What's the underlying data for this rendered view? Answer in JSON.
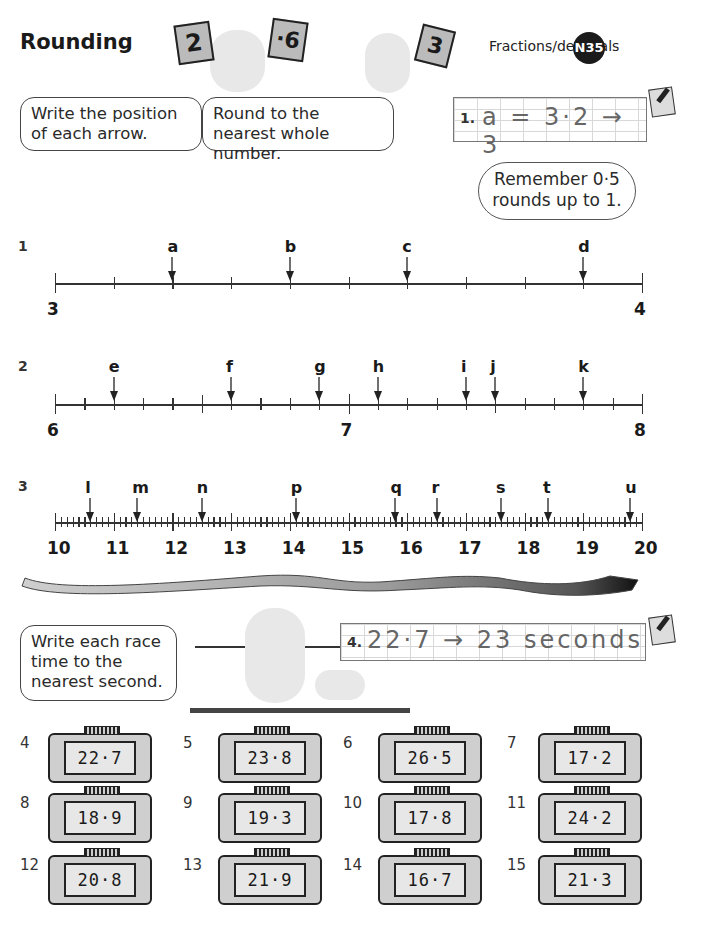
{
  "header": {
    "title": "Rounding",
    "topic": "Fractions/decimals",
    "badge": "N35",
    "illustration_cards": [
      "2",
      "·6",
      "3"
    ]
  },
  "instructions": {
    "bubble_1": "Write the position of each arrow.",
    "bubble_2": "Round to the nearest whole number.",
    "example": {
      "number": "1.",
      "text": "a = 3·2 → 3"
    },
    "reminder": "Remember 0·5 rounds up to 1."
  },
  "number_lines": [
    {
      "question": "1",
      "start": 3,
      "end": 4,
      "tick_labels": [
        "3",
        "4"
      ],
      "minor_ticks_per_unit": 10,
      "arrows": [
        {
          "label": "a",
          "value": 3.2
        },
        {
          "label": "b",
          "value": 3.4
        },
        {
          "label": "c",
          "value": 3.6
        },
        {
          "label": "d",
          "value": 3.9
        }
      ]
    },
    {
      "question": "2",
      "start": 6,
      "end": 8,
      "tick_labels": [
        "6",
        "7",
        "8"
      ],
      "minor_ticks_per_unit": 10,
      "arrows": [
        {
          "label": "e",
          "value": 6.2
        },
        {
          "label": "f",
          "value": 6.6
        },
        {
          "label": "g",
          "value": 6.9
        },
        {
          "label": "h",
          "value": 7.1
        },
        {
          "label": "i",
          "value": 7.4
        },
        {
          "label": "j",
          "value": 7.5
        },
        {
          "label": "k",
          "value": 7.8
        }
      ]
    },
    {
      "question": "3",
      "start": 10,
      "end": 20,
      "tick_labels": [
        "10",
        "11",
        "12",
        "13",
        "14",
        "15",
        "16",
        "17",
        "18",
        "19",
        "20"
      ],
      "minor_ticks_per_unit": 10,
      "arrows": [
        {
          "label": "l",
          "value": 10.6
        },
        {
          "label": "m",
          "value": 11.4
        },
        {
          "label": "n",
          "value": 12.5
        },
        {
          "label": "p",
          "value": 14.1
        },
        {
          "label": "q",
          "value": 15.8
        },
        {
          "label": "r",
          "value": 16.5
        },
        {
          "label": "s",
          "value": 17.6
        },
        {
          "label": "t",
          "value": 18.4
        },
        {
          "label": "u",
          "value": 19.8
        }
      ]
    }
  ],
  "race": {
    "instruction": "Write each race time to the nearest second.",
    "example": {
      "number": "4.",
      "text": "22·7 → 23 seconds"
    },
    "timers": [
      {
        "number": "4",
        "time": "22·7"
      },
      {
        "number": "5",
        "time": "23·8"
      },
      {
        "number": "6",
        "time": "26·5"
      },
      {
        "number": "7",
        "time": "17·2"
      },
      {
        "number": "8",
        "time": "18·9"
      },
      {
        "number": "9",
        "time": "19·3"
      },
      {
        "number": "10",
        "time": "17·8"
      },
      {
        "number": "11",
        "time": "24·2"
      },
      {
        "number": "12",
        "time": "20·8"
      },
      {
        "number": "13",
        "time": "21·9"
      },
      {
        "number": "14",
        "time": "16·7"
      },
      {
        "number": "15",
        "time": "21·3"
      }
    ]
  }
}
